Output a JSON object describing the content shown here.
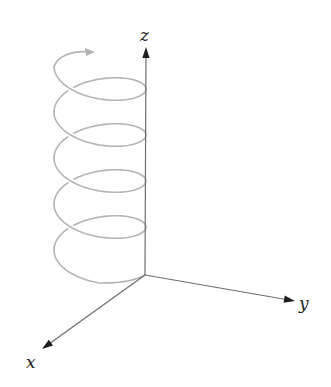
{
  "diagram": {
    "type": "3d-helix-with-axes",
    "axes": {
      "origin": [
        145,
        275
      ],
      "x": {
        "label": "x",
        "tip": [
          42,
          349
        ],
        "label_pos": [
          26,
          368
        ]
      },
      "y": {
        "label": "y",
        "tip": [
          295,
          301
        ],
        "label_pos": [
          299,
          309
        ]
      },
      "z": {
        "label": "z",
        "tip": [
          146,
          47
        ],
        "label_pos": [
          140,
          41
        ]
      },
      "color": "#6e6e6e",
      "arrow_color": "#1e1e1e"
    },
    "helix": {
      "center_x": 100,
      "radius_x": 46,
      "radius_y": 21.5,
      "pitch": 46,
      "first_right_y": 89,
      "turns": 4,
      "color": "#b4b4b4",
      "start_arrow": {
        "tip": [
          95,
          52
        ],
        "direction": "right"
      },
      "end_point": [
        145,
        275
      ]
    }
  }
}
